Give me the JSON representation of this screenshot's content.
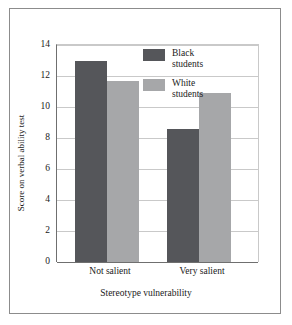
{
  "chart_data": {
    "type": "bar",
    "title": "",
    "xlabel": "Stereotype vulnerability",
    "ylabel": "Score on verbal ability test",
    "categories": [
      "Not salient",
      "Very salient"
    ],
    "series": [
      {
        "name": "Black students",
        "values": [
          13.0,
          8.6
        ],
        "color": "#55565a"
      },
      {
        "name": "White students",
        "values": [
          11.7,
          10.9
        ],
        "color": "#a6a7a9"
      }
    ],
    "ylim": [
      0,
      14
    ],
    "yticks": [
      0,
      2,
      4,
      6,
      8,
      10,
      12,
      14
    ],
    "ytick_labels": [
      "0",
      "2",
      "4",
      "6",
      "8",
      "10",
      "12",
      "14"
    ],
    "grid": true,
    "legend_position": "upper-center"
  },
  "legend": {
    "entries": [
      {
        "line1": "Black",
        "line2": "students"
      },
      {
        "line1": "White",
        "line2": "students"
      }
    ]
  },
  "axis": {
    "y_title": "Score on verbal ability test",
    "x_title": "Stereotype vulnerability",
    "y_labels": {
      "t0": "0",
      "t2": "2",
      "t4": "4",
      "t6": "6",
      "t8": "8",
      "t10": "10",
      "t12": "12",
      "t14": "14"
    },
    "x_labels": {
      "g0": "Not salient",
      "g1": "Very salient"
    }
  }
}
